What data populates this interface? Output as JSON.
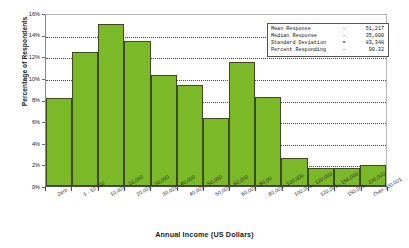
{
  "chart_data": {
    "type": "bar",
    "title": "",
    "xlabel": "Annual Income (US Dollars)",
    "ylabel": "Percentage of Respondents",
    "ylim": [
      0,
      16
    ],
    "ytick_labels": [
      "16%",
      "14%",
      "12%",
      "10%",
      "8%",
      "6%",
      "4%",
      "2%",
      "0%"
    ],
    "ytick_values": [
      16,
      14,
      12,
      10,
      8,
      6,
      4,
      2,
      0
    ],
    "grid": true,
    "legend_position": "none",
    "bar_color": "#7CB928",
    "bar_edge_color": "#3F4A24",
    "categories": [
      "Zero",
      "1 - 10,000",
      "10,001 - 20,000",
      "20,001 - 30,000",
      "30,001 - 40,000",
      "40,001 - 50,000",
      "50,001 - 60,000",
      "60,001 - 80,00",
      "80,001 - 100,000",
      "100,001 - 120,000",
      "120,001 - 150,000",
      "150,001 - 200,000",
      "Over 200,001"
    ],
    "values": [
      8.1,
      12.4,
      15.0,
      13.4,
      10.3,
      9.3,
      6.3,
      11.5,
      8.2,
      2.6,
      1.7,
      1.7,
      1.9
    ]
  },
  "stats_box": {
    "rows": [
      {
        "label": "Mean Response",
        "eq": "-",
        "value": "51,217"
      },
      {
        "label": "Median Response",
        "eq": "-",
        "value": "35,000"
      },
      {
        "label": "Standard Deviation",
        "eq": "=",
        "value": "83,348"
      },
      {
        "label": "Percent Responding",
        "eq": "-",
        "value": "90.32"
      }
    ]
  }
}
